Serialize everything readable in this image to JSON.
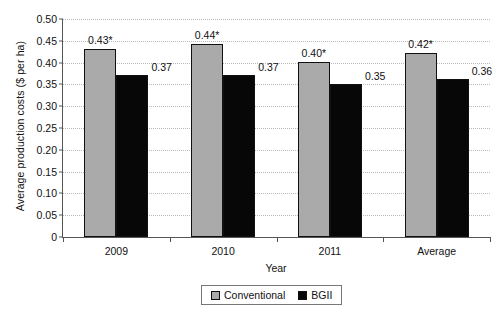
{
  "chart_data": {
    "type": "bar",
    "title": "",
    "xlabel": "Year",
    "ylabel": "Average production costs ($ per ha)",
    "categories": [
      "2009",
      "2010",
      "2011",
      "Average"
    ],
    "series": [
      {
        "name": "Conventional",
        "color": "#aaaaaa",
        "values": [
          0.43,
          0.44,
          0.4,
          0.42
        ],
        "labels": [
          "0.43*",
          "0.44*",
          "0.40*",
          "0.42*"
        ]
      },
      {
        "name": "BGII",
        "color": "#070707",
        "values": [
          0.37,
          0.37,
          0.35,
          0.36
        ],
        "labels": [
          "0.37",
          "0.37",
          "0.35",
          "0.36"
        ]
      }
    ],
    "ylim": [
      0,
      0.5
    ],
    "yticks": [
      0,
      0.05,
      0.1,
      0.15,
      0.2,
      0.25,
      0.3,
      0.35,
      0.4,
      0.45,
      0.5
    ],
    "ytick_labels": [
      "0",
      "0.05",
      "0.10",
      "0.15",
      "0.20",
      "0.25",
      "0.30",
      "0.35",
      "0.40",
      "0.45",
      "0.50"
    ],
    "grid": true,
    "legend_position": "bottom",
    "annotation": "* denotes statistical significance"
  },
  "legend": {
    "items": [
      {
        "label": "Conventional",
        "swatch": "conventional"
      },
      {
        "label": "BGII",
        "swatch": "bgii"
      }
    ]
  }
}
